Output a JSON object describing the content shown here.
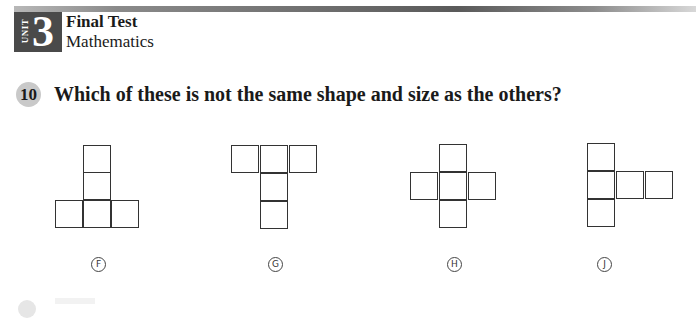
{
  "header": {
    "unit_label": "UNIT",
    "unit_number": "3",
    "title": "Final Test",
    "subject": "Mathematics"
  },
  "question": {
    "number": "10",
    "text": "Which of these is not the same shape and size as the others?"
  },
  "options": [
    {
      "letter": "F",
      "shape": "inverted-T: two stacked squares above center of a row of three"
    },
    {
      "letter": "G",
      "shape": "T: row of three squares with two stacked below center"
    },
    {
      "letter": "H",
      "shape": "plus/cross of five squares"
    },
    {
      "letter": "J",
      "shape": "column of three squares with two squares extending right from middle"
    }
  ]
}
